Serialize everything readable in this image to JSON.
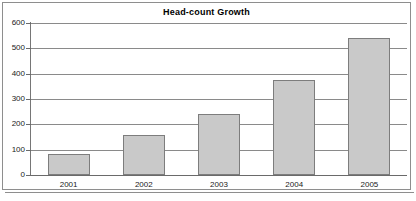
{
  "chart_data": {
    "type": "bar",
    "title": "Head-count Growth",
    "xlabel": "",
    "ylabel": "",
    "categories": [
      "2001",
      "2002",
      "2003",
      "2004",
      "2005"
    ],
    "values": [
      82,
      157,
      240,
      375,
      540
    ],
    "series": [
      {
        "name": "Head-count",
        "values": [
          82,
          157,
          240,
          375,
          540
        ]
      }
    ],
    "ylim": [
      0,
      600
    ],
    "yticks": [
      0,
      100,
      200,
      300,
      400,
      500,
      600
    ],
    "ytick_labels": [
      "0",
      "100",
      "200",
      "300",
      "400",
      "500",
      "600"
    ],
    "grid": true,
    "legend": false,
    "legend_position": "none",
    "bar_fill_color": "#c9c9c9",
    "bar_border_color": "#7d7d7d",
    "gridline_color": "#8a8a8a",
    "axis_color": "#767676",
    "text_color": "#1a1a1a",
    "background_color": "#ffffff",
    "frame_border_color": "#8e8e8e"
  }
}
